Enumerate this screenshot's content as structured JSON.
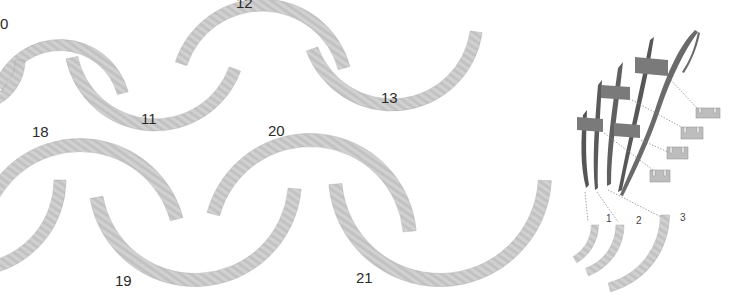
{
  "figure": {
    "background": "#ffffff",
    "arc_fill": "#c9c9c9",
    "arc_stroke_dark": "#a8a8a8",
    "rib_color": "#5a5a5a",
    "labels": [
      {
        "id": "10",
        "text": "0",
        "x": 0,
        "y": 16
      },
      {
        "id": "11",
        "text": "11",
        "x": 141,
        "y": 111
      },
      {
        "id": "12",
        "text": "12",
        "x": 236,
        "y": -5
      },
      {
        "id": "13",
        "text": "13",
        "x": 381,
        "y": 90
      },
      {
        "id": "18",
        "text": "18",
        "x": 32,
        "y": 124
      },
      {
        "id": "19",
        "text": "19",
        "x": 115,
        "y": 273
      },
      {
        "id": "20",
        "text": "20",
        "x": 268,
        "y": 123
      },
      {
        "id": "21",
        "text": "21",
        "x": 356,
        "y": 270
      }
    ],
    "detail_labels": [
      {
        "id": "1",
        "text": "1",
        "x": 606,
        "y": 214
      },
      {
        "id": "2",
        "text": "2",
        "x": 636,
        "y": 216
      },
      {
        "id": "3",
        "text": "3",
        "x": 680,
        "y": 213
      }
    ],
    "arcs": [
      {
        "id": "arc-10-upper",
        "cx": 60,
        "cy": 110,
        "r": 65,
        "start": 200,
        "end": 345,
        "w": 11
      },
      {
        "id": "arc-10-lower",
        "cx": -25,
        "cy": 60,
        "r": 45,
        "start": 0,
        "end": 70,
        "w": 10
      },
      {
        "id": "arc-11",
        "cx": 155,
        "cy": 40,
        "r": 85,
        "start": 20,
        "end": 168,
        "w": 12
      },
      {
        "id": "arc-12",
        "cx": 262,
        "cy": 90,
        "r": 85,
        "start": 198,
        "end": 345,
        "w": 12
      },
      {
        "id": "arc-13",
        "cx": 392,
        "cy": 20,
        "r": 85,
        "start": 8,
        "end": 160,
        "w": 12
      },
      {
        "id": "arc-18",
        "cx": 80,
        "cy": 245,
        "r": 100,
        "start": 195,
        "end": 345,
        "w": 13
      },
      {
        "id": "arc-18-lower",
        "cx": -30,
        "cy": 180,
        "r": 90,
        "start": 0,
        "end": 80,
        "w": 12
      },
      {
        "id": "arc-19",
        "cx": 195,
        "cy": 180,
        "r": 100,
        "start": 5,
        "end": 170,
        "w": 13
      },
      {
        "id": "arc-20",
        "cx": 310,
        "cy": 240,
        "r": 100,
        "start": 195,
        "end": 355,
        "w": 13
      },
      {
        "id": "arc-21",
        "cx": 440,
        "cy": 175,
        "r": 105,
        "start": 3,
        "end": 175,
        "w": 13
      }
    ],
    "detail_arcs": [
      {
        "id": "detail-arc-0",
        "cx": 555,
        "cy": 225,
        "r": 40,
        "start": 0,
        "end": 60,
        "w": 7
      },
      {
        "id": "detail-arc-1",
        "cx": 570,
        "cy": 225,
        "r": 50,
        "start": 0,
        "end": 70,
        "w": 8
      },
      {
        "id": "detail-arc-3",
        "cx": 590,
        "cy": 215,
        "r": 75,
        "start": 0,
        "end": 75,
        "w": 9
      }
    ]
  }
}
